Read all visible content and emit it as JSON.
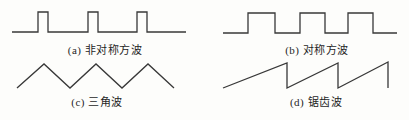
{
  "figure": {
    "stroke_color": "#383838",
    "stroke_width": 1.3,
    "text_color": "#1f1f1f",
    "panels": [
      {
        "id": "a",
        "label": "(a) 非对称方波",
        "type": "pulse-wave",
        "points": [
          [
            12,
            32
          ],
          [
            38,
            32
          ],
          [
            38,
            12
          ],
          [
            48,
            12
          ],
          [
            48,
            32
          ],
          [
            88,
            32
          ],
          [
            88,
            12
          ],
          [
            98,
            12
          ],
          [
            98,
            32
          ],
          [
            137,
            32
          ],
          [
            137,
            12
          ],
          [
            147,
            12
          ],
          [
            147,
            32
          ],
          [
            186,
            32
          ]
        ]
      },
      {
        "id": "b",
        "label": "(b) 对称方波",
        "type": "square-wave",
        "points": [
          [
            223,
            33
          ],
          [
            248,
            33
          ],
          [
            248,
            13
          ],
          [
            275,
            13
          ],
          [
            275,
            33
          ],
          [
            300,
            33
          ],
          [
            300,
            13
          ],
          [
            325,
            13
          ],
          [
            325,
            33
          ],
          [
            348,
            33
          ],
          [
            348,
            13
          ],
          [
            373,
            13
          ],
          [
            373,
            33
          ],
          [
            397,
            33
          ]
        ]
      },
      {
        "id": "c",
        "label": "(c) 三角波",
        "type": "triangle-wave",
        "points": [
          [
            17,
            88
          ],
          [
            44,
            64
          ],
          [
            70,
            88
          ],
          [
            96,
            64
          ],
          [
            122,
            88
          ],
          [
            148,
            64
          ],
          [
            174,
            88
          ]
        ]
      },
      {
        "id": "d",
        "label": "(d) 锯齿波",
        "type": "sawtooth-wave",
        "points": [
          [
            223,
            88
          ],
          [
            287,
            63
          ],
          [
            287,
            88
          ],
          [
            338,
            63
          ],
          [
            338,
            88
          ],
          [
            388,
            62
          ],
          [
            388,
            88
          ]
        ]
      }
    ]
  }
}
